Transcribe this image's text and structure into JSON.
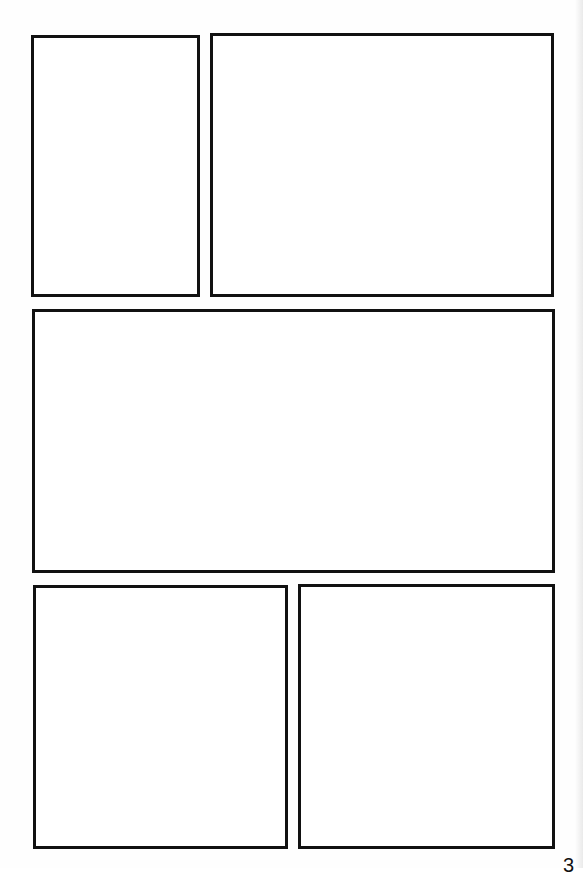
{
  "page": {
    "type": "blank comic page template",
    "background_color": "#fefefe",
    "border_color": "#111111",
    "page_number": "3"
  },
  "panels": [
    {
      "id": "panel-1",
      "row": 1,
      "label": "",
      "x": 31,
      "y": 35,
      "width": 169,
      "height": 262
    },
    {
      "id": "panel-2",
      "row": 1,
      "label": "",
      "x": 210,
      "y": 33,
      "width": 344,
      "height": 264
    },
    {
      "id": "panel-3",
      "row": 2,
      "label": "",
      "x": 32,
      "y": 309,
      "width": 523,
      "height": 264
    },
    {
      "id": "panel-4",
      "row": 3,
      "label": "",
      "x": 33,
      "y": 585,
      "width": 255,
      "height": 264
    },
    {
      "id": "panel-5",
      "row": 3,
      "label": "",
      "x": 298,
      "y": 584,
      "width": 257,
      "height": 265
    }
  ]
}
